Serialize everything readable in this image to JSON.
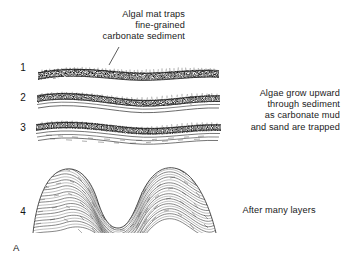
{
  "figure": {
    "label": "A",
    "title_text_blocks": {
      "top_caption": "Algal mat traps\nfine-grained\ncarbonate sediment",
      "right_caption": "Algae grow upward\nthrough sediment\nas carbonate mud\nand sand are trapped",
      "bottom_caption": "After many layers"
    },
    "panels": [
      {
        "number": "1",
        "description": "single algal mat band"
      },
      {
        "number": "2",
        "description": "mat with trapped sediment layer beneath"
      },
      {
        "number": "3",
        "description": "multiple stacked laminations"
      },
      {
        "number": "4",
        "description": "domed stromatolite with many layers"
      }
    ],
    "colors": {
      "ink": "#1a1a1a",
      "background": "#ffffff",
      "lamina": "#333333"
    }
  }
}
